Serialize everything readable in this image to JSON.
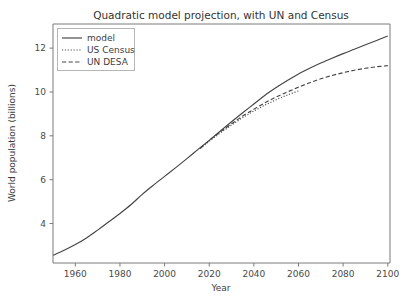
{
  "chart_data": {
    "type": "line",
    "title": "Quadratic model projection, with UN and Census",
    "xlabel": "Year",
    "ylabel": "World population (billions)",
    "xlim": [
      1950,
      2101
    ],
    "ylim": [
      2.2,
      13.1
    ],
    "xticks": [
      1960,
      1980,
      2000,
      2020,
      2040,
      2060,
      2080,
      2100
    ],
    "yticks": [
      4,
      6,
      8,
      10,
      12
    ],
    "grid": false,
    "legend_position": "upper left",
    "series": [
      {
        "name": "model",
        "style": "solid",
        "color": "#444444",
        "x": [
          1950,
          1955,
          1960,
          1965,
          1970,
          1975,
          1980,
          1985,
          1990,
          1995,
          2000,
          2005,
          2010,
          2015,
          2020,
          2025,
          2030,
          2035,
          2040,
          2045,
          2050,
          2055,
          2060,
          2065,
          2070,
          2075,
          2080,
          2085,
          2090,
          2095,
          2100
        ],
        "y": [
          2.55,
          2.78,
          3.04,
          3.34,
          3.7,
          4.08,
          4.46,
          4.87,
          5.33,
          5.75,
          6.15,
          6.55,
          6.96,
          7.38,
          7.79,
          8.22,
          8.64,
          9.05,
          9.45,
          9.85,
          10.2,
          10.52,
          10.82,
          11.08,
          11.32,
          11.54,
          11.75,
          11.95,
          12.15,
          12.35,
          12.55
        ]
      },
      {
        "name": "US Census",
        "style": "dotted",
        "color": "#444444",
        "x": [
          2016,
          2020,
          2025,
          2030,
          2035,
          2040,
          2045,
          2050,
          2055,
          2060
        ],
        "y": [
          7.42,
          7.75,
          8.13,
          8.49,
          8.83,
          9.13,
          9.4,
          9.65,
          9.86,
          10.05
        ]
      },
      {
        "name": "UN DESA",
        "style": "dashed",
        "color": "#444444",
        "x": [
          2016,
          2020,
          2025,
          2030,
          2035,
          2040,
          2045,
          2050,
          2055,
          2060,
          2065,
          2070,
          2075,
          2080,
          2085,
          2090,
          2095,
          2100
        ],
        "y": [
          7.43,
          7.79,
          8.18,
          8.55,
          8.9,
          9.21,
          9.51,
          9.77,
          10.0,
          10.22,
          10.42,
          10.6,
          10.75,
          10.88,
          10.99,
          11.08,
          11.15,
          11.2
        ]
      }
    ]
  },
  "legend": {
    "entries": [
      {
        "label": "model"
      },
      {
        "label": "US Census"
      },
      {
        "label": "UN DESA"
      }
    ]
  },
  "colors": {
    "line": "#444444",
    "spine": "#7a7a7a",
    "text": "#3d3d3d",
    "background": "#ffffff"
  }
}
